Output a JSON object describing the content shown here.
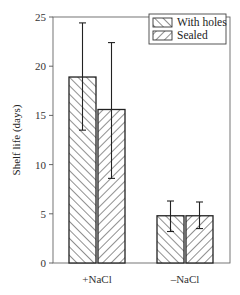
{
  "chart_data": {
    "type": "bar",
    "title": "",
    "xlabel": "",
    "ylabel": "Shelf life (days)",
    "ylim": [
      0,
      25
    ],
    "yticks": [
      0,
      5,
      10,
      15,
      20,
      25
    ],
    "categories": [
      "+NaCl",
      "–NaCl"
    ],
    "series": [
      {
        "name": "With holes",
        "pattern": "back-diagonal-hatch",
        "values": [
          18.9,
          4.8
        ],
        "error_low": [
          13.5,
          3.2
        ],
        "error_high": [
          24.4,
          6.3
        ]
      },
      {
        "name": "Sealed",
        "pattern": "forward-diagonal-hatch",
        "values": [
          15.6,
          4.8
        ],
        "error_low": [
          8.6,
          3.5
        ],
        "error_high": [
          22.4,
          6.2
        ]
      }
    ],
    "legend_position": "top-right",
    "grid": false
  },
  "colors": {
    "stroke": "#222222",
    "axis": "#555555",
    "background": "#ffffff"
  }
}
